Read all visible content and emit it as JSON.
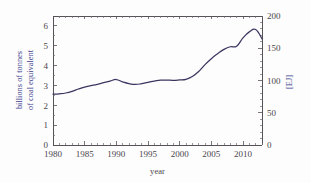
{
  "chart_data": {
    "type": "line",
    "title": "",
    "xlabel": "year",
    "ylabel": "billions of tonnes of coal equivalent",
    "ylabel_line1": "billions of tonnes",
    "ylabel_line2": "of coal equivalent",
    "y2label": "[EJ]",
    "xlim": [
      1980,
      2013
    ],
    "ylim": [
      0,
      6.5
    ],
    "y2lim": [
      0,
      200
    ],
    "xticks": [
      1980,
      1985,
      1990,
      1995,
      2000,
      2005,
      2010
    ],
    "xticklabels": [
      "1980",
      "1985",
      "1990",
      "1995",
      "2000",
      "2005",
      "2010"
    ],
    "xminorticks": [
      1981,
      1982,
      1983,
      1984,
      1986,
      1987,
      1988,
      1989,
      1991,
      1992,
      1993,
      1994,
      1996,
      1997,
      1998,
      1999,
      2001,
      2002,
      2003,
      2004,
      2006,
      2007,
      2008,
      2009,
      2011,
      2012,
      2013
    ],
    "yticks": [
      0,
      1,
      2,
      3,
      4,
      5,
      6
    ],
    "yticklabels": [
      "0",
      "1",
      "2",
      "3",
      "4",
      "5",
      "6"
    ],
    "y2ticks": [
      0,
      50,
      100,
      150,
      200
    ],
    "y2ticklabels": [
      "0",
      "50",
      "100",
      "150",
      "200"
    ],
    "grid": false,
    "legend": null,
    "line_color": "#3c3560",
    "x": [
      1980,
      1981,
      1982,
      1983,
      1984,
      1985,
      1986,
      1987,
      1988,
      1989,
      1990,
      1991,
      1992,
      1993,
      1994,
      1995,
      1996,
      1997,
      1998,
      1999,
      2000,
      2001,
      2002,
      2003,
      2004,
      2005,
      2006,
      2007,
      2008,
      2009,
      2010,
      2011,
      2012,
      2013
    ],
    "values": [
      2.56,
      2.58,
      2.62,
      2.7,
      2.82,
      2.92,
      2.99,
      3.06,
      3.14,
      3.22,
      3.3,
      3.18,
      3.09,
      3.05,
      3.09,
      3.16,
      3.22,
      3.27,
      3.27,
      3.26,
      3.28,
      3.31,
      3.45,
      3.7,
      4.05,
      4.35,
      4.6,
      4.82,
      4.95,
      4.98,
      5.4,
      5.7,
      5.82,
      5.35
    ],
    "units_note": "left axis billions of tonnes of coal equivalent; right axis exajoules"
  }
}
